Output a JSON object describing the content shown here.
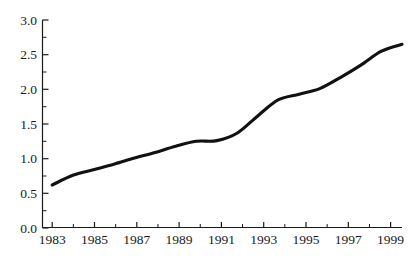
{
  "chart_data": {
    "type": "line",
    "title": "",
    "subtitle": "",
    "xlabel": "",
    "ylabel": "",
    "xlim": [
      1983,
      2000
    ],
    "ylim": [
      0.0,
      3.0
    ],
    "grid": false,
    "legend": null,
    "legend_position": "none",
    "line_color": "#111111",
    "x": [
      1983,
      1984,
      1985,
      1986,
      1987,
      1988,
      1989,
      1990,
      1991,
      1992,
      1993,
      1994,
      1995,
      1996,
      1997,
      1998,
      1999,
      2000
    ],
    "series": [
      {
        "name": "series-1",
        "values": [
          0.62,
          0.76,
          0.84,
          0.92,
          1.01,
          1.09,
          1.18,
          1.25,
          1.26,
          1.37,
          1.62,
          1.85,
          1.93,
          2.01,
          2.17,
          2.35,
          2.55,
          2.65
        ]
      }
    ],
    "x_major_ticks": [
      1983,
      1985,
      1987,
      1989,
      1991,
      1993,
      1995,
      1997,
      1999
    ],
    "x_major_tick_labels": [
      "1983",
      "1985",
      "1987",
      "1989",
      "1991",
      "1993",
      "1995",
      "1997",
      "1999"
    ],
    "x_minor_ticks": [
      1984,
      1986,
      1988,
      1990,
      1992,
      1994,
      1996,
      1998,
      2000
    ],
    "y_major_ticks": [
      0.0,
      0.5,
      1.0,
      1.5,
      2.0,
      2.5,
      3.0
    ],
    "y_major_tick_labels": [
      "0.0",
      "0.5",
      "1.0",
      "1.5",
      "2.0",
      "2.5",
      "3.0"
    ],
    "y_minor_ticks": [
      0.25,
      0.75,
      1.25,
      1.75,
      2.25,
      2.75
    ]
  },
  "axis_labels": {
    "y": {
      "t0": "0.0",
      "t1": "0.5",
      "t2": "1.0",
      "t3": "1.5",
      "t4": "2.0",
      "t5": "2.5",
      "t6": "3.0"
    },
    "x": {
      "t0": "1983",
      "t1": "1985",
      "t2": "1987",
      "t3": "1989",
      "t4": "1991",
      "t5": "1993",
      "t6": "1995",
      "t7": "1997",
      "t8": "1999"
    }
  }
}
